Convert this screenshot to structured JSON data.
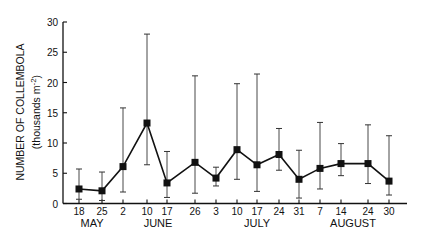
{
  "chart_data": {
    "type": "line",
    "title": "",
    "ylabel": "NUMBER OF COLLEMBOLA",
    "ylabel_units": "(thousands m",
    "ylabel_units_sup": "-2",
    "ylabel_units_close": ")",
    "xlabel": "",
    "ylim": [
      0,
      30
    ],
    "yticks": [
      0,
      5,
      10,
      15,
      20,
      25,
      30
    ],
    "grid": false,
    "legend": null,
    "months": [
      {
        "label": "MAY",
        "center_index": 0.5
      },
      {
        "label": "JUNE",
        "center_index": 3.5
      },
      {
        "label": "JULY",
        "center_index": 8.0
      },
      {
        "label": "AUGUST",
        "center_index": 12.5
      }
    ],
    "x": [
      "18",
      "25",
      "2",
      "10",
      "17",
      "26",
      "3",
      "10",
      "17",
      "24",
      "31",
      "7",
      "14",
      "24",
      "30"
    ],
    "x_month": [
      "May",
      "May",
      "June",
      "June",
      "June",
      "June",
      "July",
      "July",
      "July",
      "July",
      "July",
      "August",
      "August",
      "August",
      "August"
    ],
    "series": [
      {
        "name": "Collembola density",
        "values": [
          2.4,
          2.1,
          6.1,
          13.3,
          3.4,
          6.8,
          4.2,
          8.9,
          6.4,
          8.1,
          4.0,
          5.8,
          6.6,
          6.6,
          3.7
        ],
        "upper": [
          5.7,
          5.2,
          15.8,
          28.0,
          8.6,
          21.1,
          6.0,
          19.8,
          21.4,
          12.4,
          8.8,
          13.4,
          9.9,
          13.0,
          11.2
        ],
        "lower": [
          0.7,
          0.5,
          1.9,
          6.4,
          1.0,
          1.7,
          2.9,
          4.0,
          2.0,
          5.5,
          0.9,
          2.4,
          4.6,
          3.3,
          1.4
        ]
      }
    ],
    "x_positions_px": [
      79,
      102,
      123,
      147,
      167,
      195,
      216,
      237,
      257,
      279,
      299,
      320,
      341,
      368,
      389
    ]
  }
}
